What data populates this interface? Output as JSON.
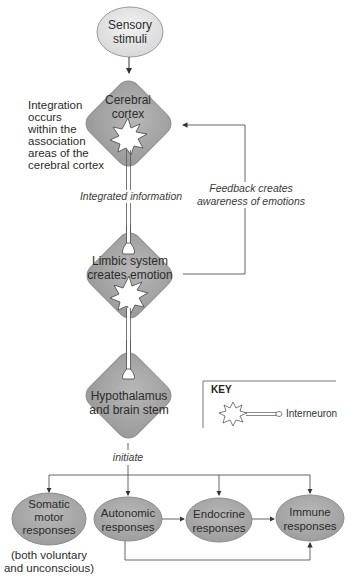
{
  "diagram": {
    "nodes": {
      "sensory": {
        "label_line1": "Sensory",
        "label_line2": "stimuli"
      },
      "cortex": {
        "label_line1": "Cerebral",
        "label_line2": "cortex"
      },
      "limbic": {
        "label_line1": "Limbic system",
        "label_line2": "creates emotion"
      },
      "hypothalamus": {
        "label_line1": "Hypothalamus",
        "label_line2": "and brain stem"
      },
      "somatic": {
        "label_line1": "Somatic",
        "label_line2": "motor",
        "label_line3": "responses"
      },
      "autonomic": {
        "label_line1": "Autonomic",
        "label_line2": "responses"
      },
      "endocrine": {
        "label_line1": "Endocrine",
        "label_line2": "responses"
      },
      "immune": {
        "label_line1": "Immune",
        "label_line2": "responses"
      }
    },
    "annotations": {
      "integration": [
        "Integration",
        "occurs",
        "within the",
        "association",
        "areas of the",
        "cerebral cortex"
      ],
      "integrated_info": "Integrated information",
      "feedback_line1": "Feedback creates",
      "feedback_line2": "awareness of emotions",
      "initiate": "initiate",
      "somatic_note_line1": "(both voluntary",
      "somatic_note_line2": "and unconscious)"
    },
    "key": {
      "title": "KEY",
      "interneuron": "Interneuron"
    },
    "colors": {
      "node_fill": "#a9a9a9",
      "oval_fill_light": "#e6e6e6",
      "line": "#4a4a4a"
    }
  }
}
